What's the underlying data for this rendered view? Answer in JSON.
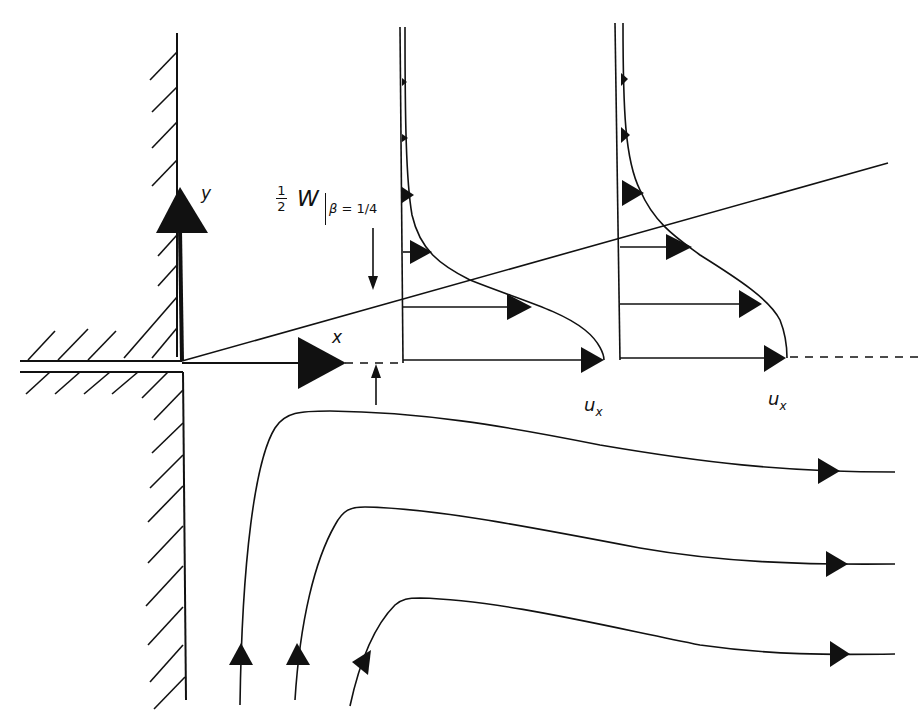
{
  "figure": {
    "axis_labels": {
      "y": "y",
      "x": "x"
    },
    "boundary_label": {
      "fraction_numerator": "1",
      "fraction_denominator": "2",
      "symbol": "W",
      "subscript_var": "β",
      "subscript_rest": " = 1/4"
    },
    "profile_labels": [
      "u",
      "u"
    ],
    "profile_label_sub": "x",
    "colors": {
      "ink": "#111111",
      "background": "#ffffff"
    }
  }
}
